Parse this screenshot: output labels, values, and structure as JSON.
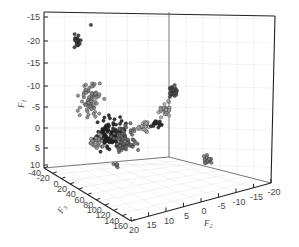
{
  "chart_data": {
    "type": "scatter3d",
    "title": "",
    "axes": {
      "vertical": {
        "label": "F",
        "subscript": "1",
        "tick_labels": [
          "-15",
          "-20",
          "-15",
          "-10",
          "-5",
          "0",
          "5",
          "10"
        ],
        "tick_y": [
          17,
          41,
          63,
          86,
          107,
          128,
          148,
          165
        ]
      },
      "depth": {
        "label": "F",
        "subscript": "3",
        "tick_labels": [
          "-40",
          "-20",
          "0",
          "20",
          "40",
          "60",
          "80",
          "100",
          "120",
          "140",
          "160"
        ],
        "range": [
          -40,
          160
        ]
      },
      "horizontal": {
        "label": "F",
        "subscript": "2",
        "tick_labels": [
          "20",
          "15",
          "10",
          "5",
          "0",
          "-5",
          "-10",
          "-15",
          "-20"
        ],
        "range": [
          20,
          -20
        ]
      }
    },
    "grid": true,
    "legend": null,
    "clusters": [
      {
        "name": "cluster-1",
        "cx": 77,
        "cy": 40,
        "rx": 5,
        "ry": 6,
        "n": 22,
        "color": "#3a3a3a"
      },
      {
        "name": "cluster-1-outlier",
        "cx": 91,
        "cy": 25,
        "rx": 0.5,
        "ry": 0.5,
        "n": 1,
        "color": "#333333"
      },
      {
        "name": "cluster-2",
        "cx": 90,
        "cy": 100,
        "rx": 10,
        "ry": 15,
        "n": 70,
        "color": "#8a8a8a"
      },
      {
        "name": "cluster-3",
        "cx": 110,
        "cy": 135,
        "rx": 13,
        "ry": 13,
        "n": 110,
        "color": "#1f1f1f"
      },
      {
        "name": "cluster-4",
        "cx": 125,
        "cy": 140,
        "rx": 10,
        "ry": 13,
        "n": 70,
        "color": "#6a6a6a"
      },
      {
        "name": "cluster-5",
        "cx": 97,
        "cy": 142,
        "rx": 6,
        "ry": 7,
        "n": 25,
        "color": "#9a9a9a"
      },
      {
        "name": "cluster-6",
        "cx": 144,
        "cy": 126,
        "rx": 5,
        "ry": 5,
        "n": 28,
        "color": "#b0b0b0"
      },
      {
        "name": "cluster-7",
        "cx": 157,
        "cy": 124,
        "rx": 6,
        "ry": 3,
        "n": 16,
        "color": "#2a2a2a"
      },
      {
        "name": "cluster-8",
        "cx": 165,
        "cy": 109,
        "rx": 5,
        "ry": 6,
        "n": 30,
        "color": "#a8a8a8"
      },
      {
        "name": "cluster-9",
        "cx": 173,
        "cy": 91,
        "rx": 4,
        "ry": 6,
        "n": 26,
        "color": "#4a4a4a"
      },
      {
        "name": "cluster-10",
        "cx": 207,
        "cy": 159,
        "rx": 4,
        "ry": 5,
        "n": 18,
        "color": "#7a7a7a"
      },
      {
        "name": "cluster-11",
        "cx": 116,
        "cy": 165,
        "rx": 4,
        "ry": 2,
        "n": 6,
        "color": "#777777"
      }
    ]
  }
}
